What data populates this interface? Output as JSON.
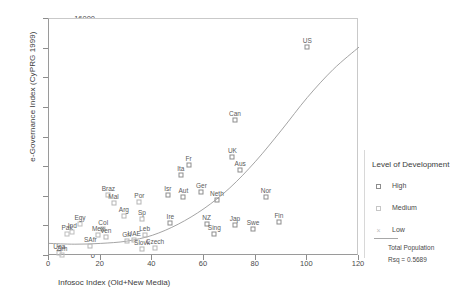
{
  "chart_data": {
    "type": "scatter",
    "title": "",
    "xlabel": "Infosoc Index (Old+New Media)",
    "ylabel": "e-Governance Index (CyPRG 1999)",
    "xlim": [
      0,
      120
    ],
    "ylim": [
      0,
      16000
    ],
    "xticks": [
      0,
      20,
      40,
      60,
      80,
      100,
      120
    ],
    "yticks": [
      0,
      2000,
      4000,
      6000,
      8000,
      10000,
      12000,
      14000,
      16000
    ],
    "grid": false,
    "legend_position": "right",
    "points": [
      {
        "label": "US",
        "x": 100,
        "y": 14100,
        "level": "high"
      },
      {
        "label": "Can",
        "x": 72,
        "y": 9200,
        "level": "high"
      },
      {
        "label": "UK",
        "x": 71,
        "y": 6700,
        "level": "high"
      },
      {
        "label": "Fr",
        "x": 54,
        "y": 6150,
        "level": "high"
      },
      {
        "label": "Ita",
        "x": 51,
        "y": 5500,
        "level": "high"
      },
      {
        "label": "Aus",
        "x": 74,
        "y": 5800,
        "level": "high"
      },
      {
        "label": "Isr",
        "x": 46,
        "y": 4150,
        "level": "high"
      },
      {
        "label": "Aut",
        "x": 52,
        "y": 3950,
        "level": "high"
      },
      {
        "label": "Ger",
        "x": 59,
        "y": 4300,
        "level": "high"
      },
      {
        "label": "Neth",
        "x": 65,
        "y": 3800,
        "level": "high"
      },
      {
        "label": "Nor",
        "x": 84,
        "y": 3950,
        "level": "high"
      },
      {
        "label": "Braz",
        "x": 23,
        "y": 4100,
        "level": "medium"
      },
      {
        "label": "Mal",
        "x": 25,
        "y": 3550,
        "level": "medium"
      },
      {
        "label": "Por",
        "x": 35,
        "y": 3650,
        "level": "medium"
      },
      {
        "label": "Arg",
        "x": 29,
        "y": 2700,
        "level": "medium"
      },
      {
        "label": "Sp",
        "x": 36,
        "y": 2500,
        "level": "medium"
      },
      {
        "label": "Ire",
        "x": 47,
        "y": 2200,
        "level": "high"
      },
      {
        "label": "NZ",
        "x": 61,
        "y": 2150,
        "level": "high"
      },
      {
        "label": "Jap",
        "x": 72,
        "y": 2100,
        "level": "high"
      },
      {
        "label": "Swe",
        "x": 79,
        "y": 1800,
        "level": "high"
      },
      {
        "label": "Fin",
        "x": 89,
        "y": 2300,
        "level": "high"
      },
      {
        "label": "Sing",
        "x": 64,
        "y": 1500,
        "level": "high"
      },
      {
        "label": "Egy",
        "x": 12,
        "y": 2150,
        "level": "low"
      },
      {
        "label": "Col",
        "x": 21,
        "y": 1850,
        "level": "medium"
      },
      {
        "label": "Mex",
        "x": 19,
        "y": 1450,
        "level": "medium"
      },
      {
        "label": "Ven",
        "x": 22,
        "y": 1300,
        "level": "medium"
      },
      {
        "label": "Ind",
        "x": 9,
        "y": 1650,
        "level": "low"
      },
      {
        "label": "Pak",
        "x": 7,
        "y": 1500,
        "level": "low"
      },
      {
        "label": "Leb",
        "x": 37,
        "y": 1400,
        "level": "medium"
      },
      {
        "label": "Grl",
        "x": 30,
        "y": 1000,
        "level": "medium"
      },
      {
        "label": "UAE",
        "x": 33,
        "y": 1050,
        "level": "medium"
      },
      {
        "label": "SAfr",
        "x": 16,
        "y": 700,
        "level": "medium"
      },
      {
        "label": "Slovk",
        "x": 36,
        "y": 500,
        "level": "medium"
      },
      {
        "label": "Czech",
        "x": 41,
        "y": 550,
        "level": "medium"
      },
      {
        "label": "Uga",
        "x": 4,
        "y": 200,
        "level": "low"
      },
      {
        "label": "Zim",
        "x": 5,
        "y": 100,
        "level": "low"
      }
    ],
    "fit_curve": {
      "name": "Total Population",
      "rsq_label": "Rsq = 0.5689",
      "points": [
        [
          0,
          850
        ],
        [
          10,
          800
        ],
        [
          20,
          850
        ],
        [
          30,
          1000
        ],
        [
          40,
          1400
        ],
        [
          50,
          2150
        ],
        [
          60,
          3200
        ],
        [
          70,
          4600
        ],
        [
          80,
          6400
        ],
        [
          90,
          8500
        ],
        [
          100,
          10700
        ],
        [
          110,
          12600
        ],
        [
          120,
          14100
        ]
      ]
    }
  },
  "legend": {
    "title": "Level of Development",
    "entries": [
      {
        "label": "High",
        "marker": "square-open"
      },
      {
        "label": "Medium",
        "marker": "square-faint"
      },
      {
        "label": "Low",
        "marker": "cross"
      }
    ],
    "fit_label": "Total Population",
    "rsq": "Rsq = 0.5689"
  }
}
